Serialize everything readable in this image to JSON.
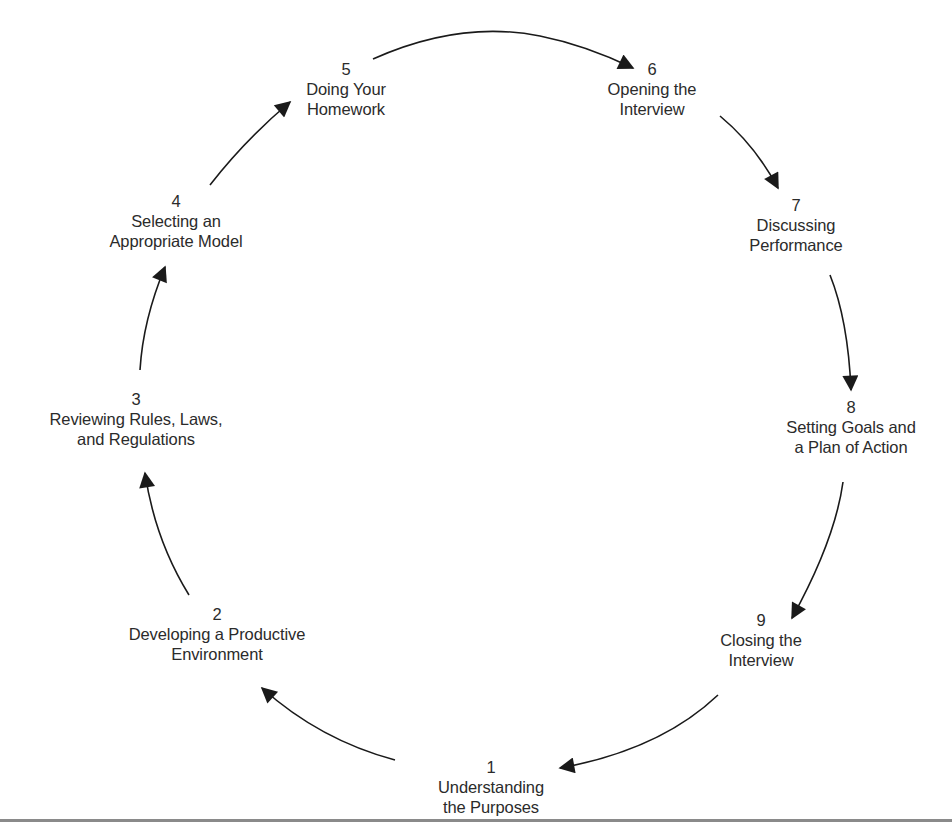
{
  "diagram": {
    "type": "cycle",
    "direction": "clockwise",
    "colors": {
      "text": "#2b2b2b",
      "arrow": "#1a1a1a",
      "background": "#ffffff",
      "rule": "#8a8a8a"
    },
    "steps": [
      {
        "number": "1",
        "lines": [
          "Understanding",
          "the Purposes"
        ]
      },
      {
        "number": "2",
        "lines": [
          "Developing a Productive",
          "Environment"
        ]
      },
      {
        "number": "3",
        "lines": [
          "Reviewing Rules, Laws,",
          "and Regulations"
        ]
      },
      {
        "number": "4",
        "lines": [
          "Selecting an",
          "Appropriate Model"
        ]
      },
      {
        "number": "5",
        "lines": [
          "Doing Your",
          "Homework"
        ]
      },
      {
        "number": "6",
        "lines": [
          "Opening the",
          "Interview"
        ]
      },
      {
        "number": "7",
        "lines": [
          "Discussing",
          "Performance"
        ]
      },
      {
        "number": "8",
        "lines": [
          "Setting Goals and",
          "a Plan of Action"
        ]
      },
      {
        "number": "9",
        "lines": [
          "Closing the",
          "Interview"
        ]
      }
    ],
    "connections": [
      {
        "from": "1",
        "to": "2"
      },
      {
        "from": "2",
        "to": "3"
      },
      {
        "from": "3",
        "to": "4"
      },
      {
        "from": "4",
        "to": "5"
      },
      {
        "from": "5",
        "to": "6"
      },
      {
        "from": "6",
        "to": "7"
      },
      {
        "from": "7",
        "to": "8"
      },
      {
        "from": "8",
        "to": "9"
      },
      {
        "from": "9",
        "to": "1"
      }
    ]
  }
}
